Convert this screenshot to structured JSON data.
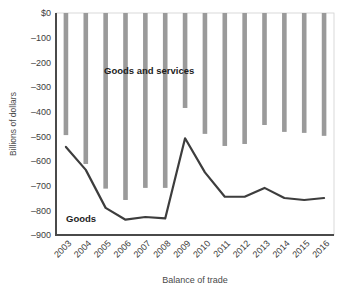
{
  "chart_data": {
    "type": "bar",
    "title": "",
    "subtitle": "",
    "xlabel": "Balance of trade",
    "ylabel": "Billions of dollars",
    "categories": [
      "2003",
      "2004",
      "2005",
      "2006",
      "2007",
      "2008",
      "2009",
      "2010",
      "2011",
      "2012",
      "2013",
      "2014",
      "2015",
      "2016"
    ],
    "ylim": [
      -900,
      0
    ],
    "ytick_labels": [
      "$0",
      "–100",
      "–200",
      "–300",
      "–400",
      "–500",
      "–600",
      "–700",
      "–800",
      "–900"
    ],
    "ytick_values": [
      0,
      -100,
      -200,
      -300,
      -400,
      -500,
      -600,
      -700,
      -800,
      -900
    ],
    "grid": false,
    "legend_position": "inline-annotations",
    "series": [
      {
        "name": "Goods and services",
        "render": "bar",
        "color": "#9a9a9a",
        "annotation": "Goods and services",
        "values": [
          -495,
          -612,
          -712,
          -758,
          -709,
          -709,
          -385,
          -490,
          -539,
          -531,
          -454,
          -482,
          -486,
          -498
        ]
      },
      {
        "name": "Goods",
        "render": "line",
        "color": "#3d3d3d",
        "annotation": "Goods",
        "values": [
          -543,
          -636,
          -790,
          -838,
          -827,
          -833,
          -508,
          -646,
          -745,
          -745,
          -709,
          -750,
          -758,
          -750
        ]
      }
    ],
    "annotations": [
      {
        "text": "Goods and services",
        "series": "Goods and services"
      },
      {
        "text": "Goods",
        "series": "Goods"
      }
    ]
  },
  "colors": {
    "bar": "#9a9a9a",
    "line": "#3d3d3d",
    "axis": "#4a4a4a",
    "background": "#ffffff",
    "plot_border": "#c8c8c8"
  }
}
